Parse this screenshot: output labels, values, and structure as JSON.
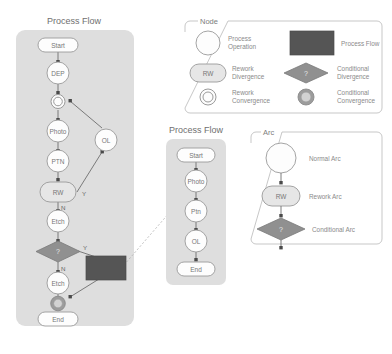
{
  "canvas": {
    "width": 392,
    "height": 354,
    "background": "#ffffff"
  },
  "colors": {
    "panel": "#dedede",
    "node_fill": "#fdfdfd",
    "node_stroke": "#9a9a9a",
    "rework_fill": "#e6e6e6",
    "conditional_fill": "#909090",
    "process_flow_fill": "#555555",
    "edge": "#6e6e6e",
    "dashed_edge": "#b0b0b0",
    "legend_border": "#b9b9b9",
    "text": "#7d7d7d"
  },
  "flow_main": {
    "title": "Process Flow",
    "nodes": [
      {
        "id": "start",
        "label": "Start",
        "type": "terminal"
      },
      {
        "id": "dep",
        "label": "DEP",
        "type": "operation"
      },
      {
        "id": "conv1",
        "label": "",
        "type": "rework-convergence"
      },
      {
        "id": "photo",
        "label": "Photo",
        "type": "operation"
      },
      {
        "id": "ptn",
        "label": "PTN",
        "type": "operation"
      },
      {
        "id": "rw",
        "label": "RW",
        "type": "rework-divergence"
      },
      {
        "id": "etch1",
        "label": "Etch",
        "type": "operation"
      },
      {
        "id": "cond",
        "label": "?",
        "type": "conditional-divergence"
      },
      {
        "id": "etch2",
        "label": "Etch",
        "type": "operation"
      },
      {
        "id": "conv2",
        "label": "",
        "type": "conditional-convergence"
      },
      {
        "id": "end",
        "label": "End",
        "type": "terminal"
      },
      {
        "id": "ol",
        "label": "OL",
        "type": "operation"
      },
      {
        "id": "subflow",
        "label": "",
        "type": "process-flow"
      }
    ],
    "branch_labels": {
      "rw_yes": "Y",
      "rw_no": "N",
      "cond_yes": "Y",
      "cond_no": "N"
    }
  },
  "flow_sub": {
    "title": "Process Flow",
    "nodes": [
      {
        "id": "s_start",
        "label": "Start",
        "type": "terminal"
      },
      {
        "id": "s_photo",
        "label": "Photo",
        "type": "operation"
      },
      {
        "id": "s_ptn",
        "label": "Ptn",
        "type": "operation"
      },
      {
        "id": "s_ol",
        "label": "OL",
        "type": "operation"
      },
      {
        "id": "s_end",
        "label": "End",
        "type": "terminal"
      }
    ]
  },
  "legend_node": {
    "title": "Node",
    "items": [
      {
        "shape": "circle",
        "label_line1": "Process",
        "label_line2": "Operation"
      },
      {
        "shape": "dark-rect",
        "label_line1": "Process Flow",
        "label_line2": ""
      },
      {
        "shape": "stadium",
        "label_line1": "Rework",
        "label_line2": "Divergence",
        "glyph": "RW"
      },
      {
        "shape": "diamond",
        "label_line1": "Conditional",
        "label_line2": "Divergence",
        "glyph": "?"
      },
      {
        "shape": "double-circle",
        "label_line1": "Rework",
        "label_line2": "Convergence"
      },
      {
        "shape": "filled-double-circle",
        "label_line1": "Conditional",
        "label_line2": "Convergence"
      }
    ]
  },
  "legend_arc": {
    "title": "Arc",
    "items": [
      {
        "shape": "circle",
        "label": "Normal Arc"
      },
      {
        "shape": "stadium",
        "label": "Rework Arc",
        "glyph": "RW"
      },
      {
        "shape": "diamond",
        "label": "Conditional Arc",
        "glyph": "?"
      }
    ]
  }
}
